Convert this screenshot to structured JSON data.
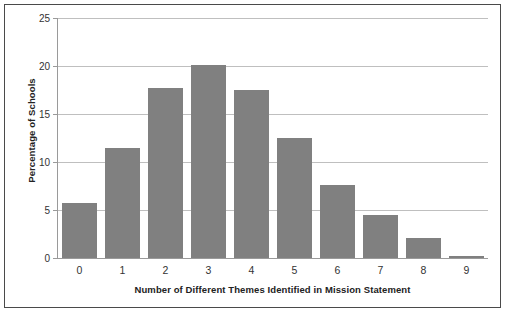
{
  "chart_data": {
    "type": "bar",
    "title": "",
    "xlabel": "Number of Different Themes Identified in Mission Statement",
    "ylabel": "Percentage of Schools",
    "categories": [
      "0",
      "1",
      "2",
      "3",
      "4",
      "5",
      "6",
      "7",
      "8",
      "9"
    ],
    "values": [
      5.7,
      11.5,
      17.7,
      20.1,
      17.5,
      12.5,
      7.6,
      4.5,
      2.1,
      0.2
    ],
    "ylim": [
      0,
      25
    ],
    "yticks": [
      "0",
      "5",
      "10",
      "15",
      "20",
      "25"
    ],
    "ytick_values": [
      0,
      5,
      10,
      15,
      20,
      25
    ],
    "grid": "horizontal",
    "legend": "none",
    "bar_color": "#808080",
    "gridline_color": "#bfbfbf",
    "axis_color": "#9a9a9a",
    "frame_color": "#4a4a4a",
    "background": "#ffffff"
  }
}
